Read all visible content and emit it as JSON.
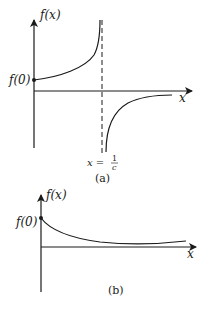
{
  "diagram_a": {
    "y_axis_label": "f(x)",
    "intercept_label": "f(0)",
    "x_axis_label": "x",
    "asymptote_label_lhs": "x =",
    "asymptote_label_num": "1",
    "asymptote_label_den": "c",
    "caption": "(a)",
    "description": "Function rising from f(0) toward a vertical asymptote at x = 1/c, then approaching 0 from below for x > 1/c"
  },
  "diagram_b": {
    "y_axis_label": "f(x)",
    "intercept_label": "f(0)",
    "x_axis_label": "x",
    "caption": "(b)",
    "description": "Function decaying from f(0) toward a positive horizontal level"
  },
  "colors": {
    "ink": "#1a1a1a",
    "background": "#ffffff"
  }
}
